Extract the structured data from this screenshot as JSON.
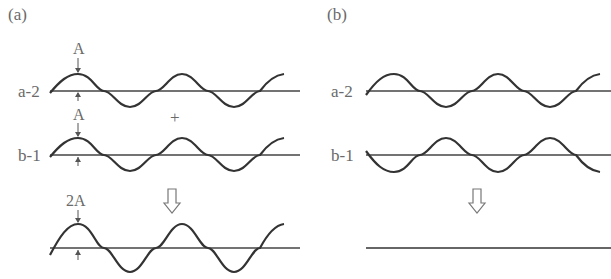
{
  "panels": {
    "a": {
      "label": "(a)",
      "rows": [
        {
          "name": "a-2",
          "amplitude_label": "A"
        },
        {
          "name": "b-1",
          "amplitude_label": "A"
        }
      ],
      "operator": "+",
      "result_amplitude_label": "2A",
      "result_arrow": "⇩",
      "description": "In-phase superposition: constructive interference doubles amplitude"
    },
    "b": {
      "label": "(b)",
      "rows": [
        {
          "name": "a-2"
        },
        {
          "name": "b-1"
        }
      ],
      "result_arrow": "⇩",
      "description": "Out-of-phase superposition: destructive interference gives a flat line"
    }
  },
  "colors": {
    "wave": "#333333",
    "label": "#6a6a6a",
    "background": "#ffffff"
  }
}
